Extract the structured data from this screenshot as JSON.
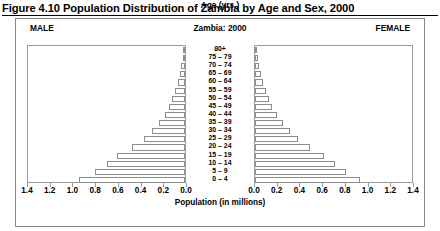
{
  "figure": {
    "caption": "Figure 4.10 Population Distribution of Zambia by Age and Sex, 2000",
    "header_left": "MALE",
    "header_center": "Zambia: 2000",
    "header_right": "FEMALE",
    "age_axis_label": "Age (yrs.)",
    "x_axis_title": "Population (in millions)"
  },
  "chart_data": {
    "type": "bar",
    "subtype": "population-pyramid",
    "title": "Figure 4.10 Population Distribution of Zambia by Age and Sex, 2000",
    "chart_label": "Zambia: 2000",
    "xlabel": "Population (in millions)",
    "ylabel": "Age (yrs.)",
    "grid": false,
    "legend_position": "top",
    "orientation": "horizontal",
    "xlim_left": [
      1.4,
      0.0
    ],
    "xlim_right": [
      0.0,
      1.4
    ],
    "x_max": 1.4,
    "left_tick_labels": [
      "1.4",
      "1.2",
      "1.0",
      "0.8",
      "0.6",
      "0.4",
      "0.2",
      "0.0"
    ],
    "right_tick_labels": [
      "0.0",
      "0.2",
      "0.4",
      "0.6",
      "0.8",
      "1.0",
      "1.2",
      "1.4"
    ],
    "tick_values": [
      1.4,
      1.2,
      1.0,
      0.8,
      0.6,
      0.4,
      0.2,
      0.0
    ],
    "categories": [
      "80+",
      "75 – 79",
      "70 – 74",
      "65 – 69",
      "60 – 64",
      "55 – 59",
      "50 – 54",
      "45 – 49",
      "40 – 44",
      "35 – 39",
      "30 – 34",
      "25 – 29",
      "20 – 24",
      "15 – 19",
      "10 – 14",
      "5 – 9",
      "0 – 4"
    ],
    "series": [
      {
        "name": "MALE",
        "side": "left",
        "values": [
          0.012,
          0.019,
          0.031,
          0.046,
          0.066,
          0.087,
          0.112,
          0.141,
          0.18,
          0.232,
          0.292,
          0.365,
          0.47,
          0.6,
          0.69,
          0.79,
          0.93
        ]
      },
      {
        "name": "FEMALE",
        "side": "right",
        "values": [
          0.016,
          0.024,
          0.036,
          0.052,
          0.072,
          0.094,
          0.12,
          0.15,
          0.19,
          0.243,
          0.305,
          0.38,
          0.48,
          0.605,
          0.7,
          0.8,
          0.925
        ]
      }
    ]
  }
}
